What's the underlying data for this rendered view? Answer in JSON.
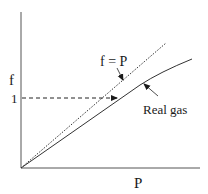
{
  "diagram": {
    "type": "fugacity vs pressure",
    "axes": {
      "x_label": "P",
      "y_label": "f",
      "y_tick_label": "1"
    },
    "lines": [
      {
        "name": "ideal",
        "label": "f = P",
        "style": "dotted"
      },
      {
        "name": "real",
        "label": "Real gas",
        "style": "solid"
      }
    ],
    "reference_line": {
      "style": "dashed",
      "at_value": "1"
    },
    "colors": {
      "line": "#2a2a2a",
      "background": "#ffffff"
    }
  }
}
